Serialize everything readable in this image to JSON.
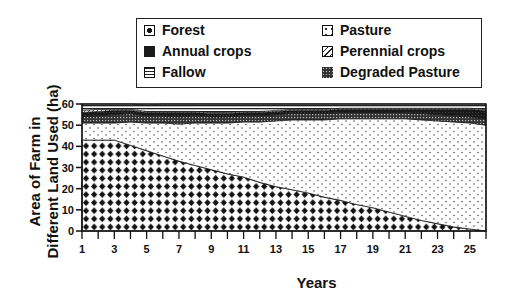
{
  "chart_data": {
    "type": "area",
    "stacked": true,
    "title": "",
    "xlabel": "Years",
    "ylabel": "Area of Farm in Different Land Used (ha)",
    "ylabel_lines": [
      "Area of Farm in",
      "Different Land Used (ha)"
    ],
    "xlim": [
      1,
      26
    ],
    "ylim": [
      0,
      60
    ],
    "x_ticks": [
      1,
      2,
      3,
      4,
      5,
      6,
      7,
      8,
      9,
      10,
      11,
      12,
      13,
      14,
      15,
      16,
      17,
      18,
      19,
      20,
      21,
      22,
      23,
      24,
      25,
      26
    ],
    "x_tick_labels": [
      "1",
      "3",
      "5",
      "7",
      "9",
      "11",
      "13",
      "15",
      "17",
      "19",
      "21",
      "23",
      "25"
    ],
    "y_ticks": [
      0,
      10,
      20,
      30,
      40,
      50,
      60
    ],
    "y_tick_labels": [
      "0",
      "10",
      "20",
      "30",
      "40",
      "50",
      "60"
    ],
    "grid": false,
    "legend_position": "top",
    "x": [
      1,
      2,
      3,
      4,
      5,
      6,
      7,
      8,
      9,
      10,
      11,
      12,
      13,
      14,
      15,
      16,
      17,
      18,
      19,
      20,
      21,
      22,
      23,
      24,
      25,
      26
    ],
    "series": [
      {
        "name": "Forest",
        "pattern": "diamonds",
        "values": [
          43,
          43,
          43,
          40.5,
          38,
          35.5,
          33,
          31,
          29,
          27,
          25.5,
          23,
          21,
          19.5,
          18,
          16,
          14.5,
          12.5,
          11,
          9,
          7,
          5,
          3.5,
          2,
          1,
          0
        ]
      },
      {
        "name": "Pasture",
        "pattern": "dots",
        "values": [
          8,
          8,
          8,
          11,
          13,
          15.5,
          17.5,
          20,
          22,
          24,
          26,
          28.5,
          31,
          33,
          34.5,
          36.5,
          38.5,
          40.5,
          42,
          44,
          46,
          47.5,
          48.5,
          49.5,
          50,
          50
        ]
      },
      {
        "name": "Degraded Pasture",
        "pattern": "crosshatch",
        "values": [
          3,
          3.5,
          4,
          4,
          3.5,
          3.5,
          3.5,
          3.5,
          3,
          3,
          3,
          3,
          3,
          3,
          3,
          3,
          3,
          3,
          3,
          3,
          3,
          3,
          3,
          3,
          3,
          3
        ]
      },
      {
        "name": "Annual crops",
        "pattern": "dark",
        "values": [
          2,
          2,
          2,
          1.5,
          1.5,
          1.5,
          2,
          1.5,
          1.5,
          1.5,
          1.5,
          1.5,
          1.5,
          1.5,
          1.5,
          1.5,
          1.5,
          1.5,
          1.5,
          1.5,
          1.5,
          2,
          2.5,
          3,
          3.5,
          4
        ]
      },
      {
        "name": "Perennial crops",
        "pattern": "diagonal",
        "values": [
          1,
          1,
          0.5,
          0.5,
          0.5,
          0.5,
          0.5,
          0.5,
          0.5,
          0.5,
          0.5,
          0.5,
          0.5,
          0.5,
          0.5,
          0.5,
          0.5,
          0.5,
          0.5,
          0.5,
          0.5,
          0.5,
          0.5,
          0.5,
          0.5,
          0.5
        ]
      },
      {
        "name": "Fallow",
        "pattern": "hlines",
        "values": [
          3,
          2.5,
          2.5,
          2.5,
          3,
          3.5,
          3.5,
          3.5,
          4,
          4,
          3.5,
          3.5,
          3,
          3,
          2.5,
          2.5,
          2,
          2,
          2,
          2,
          2,
          2,
          2,
          2,
          2,
          2.5
        ]
      }
    ]
  },
  "legend": {
    "items": [
      {
        "label": "Forest",
        "pattern": "diamonds"
      },
      {
        "label": "Pasture",
        "pattern": "dots"
      },
      {
        "label": "Annual crops",
        "pattern": "dark"
      },
      {
        "label": "Perennial crops",
        "pattern": "diagonal"
      },
      {
        "label": "Fallow",
        "pattern": "hlines"
      },
      {
        "label": "Degraded Pasture",
        "pattern": "crosshatch"
      }
    ]
  },
  "axes": {
    "x_title": "Years",
    "y_title_line1": "Area of Farm in",
    "y_title_line2": "Different Land Used (ha)"
  }
}
